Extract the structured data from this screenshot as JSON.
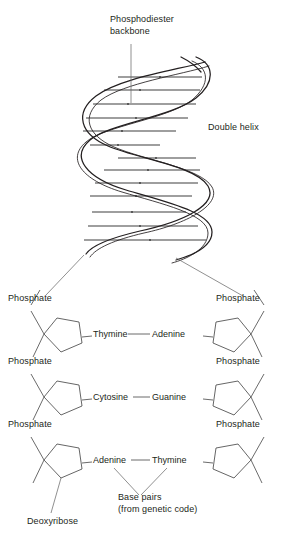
{
  "figure": {
    "title_side": "Double helix opened to show structure",
    "labels": {
      "backbone": "Phosphodiester\nbackbone",
      "double_helix": "Double helix",
      "deoxyribose": "Deoxyribose",
      "base_pairs": "Base pairs\n(from genetic code)"
    },
    "phosphate_label": "Phosphate",
    "colors": {
      "ink": "#231f20",
      "rung": "#9a9a9a",
      "leader": "#555555"
    }
  },
  "helix": {
    "turns": 3,
    "rung_count": 13,
    "strand_count": 2
  },
  "base_pairs": [
    {
      "left": "Thymine",
      "right": "Adenine"
    },
    {
      "left": "Cytosine",
      "right": "Guanine"
    },
    {
      "left": "Adenine",
      "right": "Thymine"
    }
  ],
  "phosphates": [
    {
      "side": "left",
      "row": 0
    },
    {
      "side": "right",
      "row": 0
    },
    {
      "side": "left",
      "row": 1
    },
    {
      "side": "right",
      "row": 1
    },
    {
      "side": "left",
      "row": 2
    },
    {
      "side": "right",
      "row": 2
    }
  ]
}
